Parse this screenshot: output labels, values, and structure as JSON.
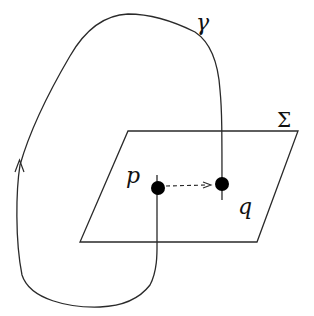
{
  "caption_fragment": "",
  "labels": {
    "curve": "γ",
    "surface": "Σ",
    "point_p": "p",
    "point_q": "q"
  },
  "colors": {
    "stroke": "#2a2a2a",
    "point_fill": "#000000",
    "background": "#ffffff"
  },
  "diagram": {
    "surface": {
      "shape": "parallelogram",
      "corners": [
        [
          128,
          131
        ],
        [
          298,
          131
        ],
        [
          257,
          242
        ],
        [
          80,
          242
        ]
      ]
    },
    "points": [
      {
        "name": "p",
        "x": 158,
        "y": 188
      },
      {
        "name": "q",
        "x": 222,
        "y": 184
      }
    ],
    "arrow": {
      "from": "p",
      "to": "q",
      "style": "dashed"
    },
    "curve": {
      "name": "γ",
      "closed_through": [
        "q",
        "p"
      ],
      "direction_arrow": {
        "x": 20,
        "y": 162,
        "pointing": "up"
      }
    }
  }
}
